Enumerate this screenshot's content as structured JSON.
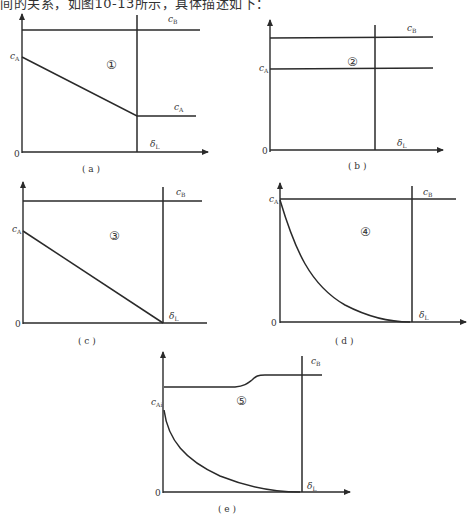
{
  "header": {
    "text": "间的关系，如图10-13所示，具体描述如下："
  },
  "panels": [
    {
      "id": "a",
      "caption": "( a )",
      "region_label": "①",
      "labels": {
        "cB": "c",
        "cB_sub": "B",
        "cA_left": "c",
        "cA_left_sub": "A",
        "cA_right": "c",
        "cA_right_sub": "A",
        "delta": "δ",
        "delta_sub": "L",
        "origin": "0"
      }
    },
    {
      "id": "b",
      "caption": "( b )",
      "region_label": "②",
      "labels": {
        "cB": "c",
        "cB_sub": "B",
        "cA_left": "c",
        "cA_left_sub": "A",
        "delta": "δ",
        "delta_sub": "L",
        "origin": "0"
      }
    },
    {
      "id": "c",
      "caption": "( c )",
      "region_label": "③",
      "labels": {
        "cB": "c",
        "cB_sub": "B",
        "cA_left": "c",
        "cA_left_sub": "A",
        "delta": "δ",
        "delta_sub": "L",
        "origin": "0"
      }
    },
    {
      "id": "d",
      "caption": "( d )",
      "region_label": "④",
      "labels": {
        "cB": "c",
        "cB_sub": "B",
        "cA_left": "c",
        "cA_left_sub": "A",
        "delta": "δ",
        "delta_sub": "L",
        "origin": "0"
      }
    },
    {
      "id": "e",
      "caption": "( e )",
      "region_label": "⑤",
      "labels": {
        "cB": "c",
        "cB_sub": "B",
        "cA_left": "c",
        "cA_left_sub": "Ai",
        "delta": "δ",
        "delta_sub": "L",
        "origin": "0"
      }
    }
  ]
}
